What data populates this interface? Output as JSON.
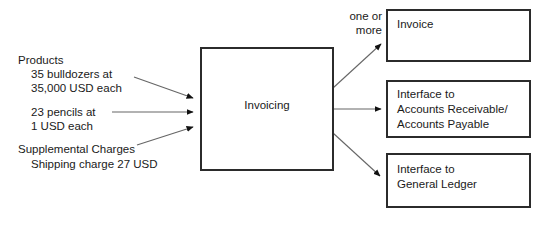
{
  "diagram": {
    "colors": {
      "stroke": "#2b2b2b",
      "line": "#555555",
      "text": "#1a1a1a",
      "background": "#ffffff"
    },
    "inputs": [
      {
        "id": "products",
        "heading": "Products",
        "lines": [
          "35 bulldozers at",
          "35,000 USD each"
        ]
      },
      {
        "id": "pencils",
        "heading": "",
        "lines": [
          "23 pencils at",
          "1 USD each"
        ]
      },
      {
        "id": "supplemental",
        "heading": "Supplemental Charges",
        "lines": [
          "Shipping charge 27 USD"
        ]
      }
    ],
    "process": {
      "id": "invoicing",
      "label": "Invoicing"
    },
    "edge_labels": [
      {
        "id": "one-or-more",
        "line1": "one or",
        "line2": "more"
      }
    ],
    "outputs": [
      {
        "id": "invoice",
        "lines": [
          "Invoice"
        ]
      },
      {
        "id": "interface-ar-ap",
        "lines": [
          "Interface to",
          "Accounts Receivable/",
          "Accounts Payable"
        ]
      },
      {
        "id": "interface-gl",
        "lines": [
          "Interface to",
          "General Ledger"
        ]
      }
    ]
  }
}
